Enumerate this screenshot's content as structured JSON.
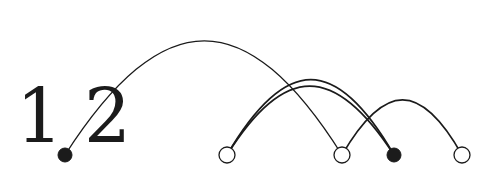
{
  "figure": {
    "label": "1.2",
    "label_parts": {
      "first_digit": "1",
      "second_digit": "2"
    },
    "background_color": "#ffffff",
    "stroke_color": "#1b1b1b",
    "fill_node_color": "#1b1b1b",
    "open_node_fill": "#ffffff",
    "width": 493,
    "height": 176
  },
  "chart_data": {
    "type": "arc-diagram",
    "title": "1.2",
    "xlabel": "",
    "ylabel": "",
    "grid": false,
    "legend": "none",
    "baseline_y": 155,
    "node_radius_open": 8,
    "node_radius_filled": 7,
    "nodes": [
      {
        "id": "n1",
        "x": 65,
        "y": 155,
        "style": "filled",
        "label": "",
        "note": "serves as the decimal point of 1.2"
      },
      {
        "id": "n2",
        "x": 227,
        "y": 155,
        "style": "open",
        "label": ""
      },
      {
        "id": "n3",
        "x": 342,
        "y": 155,
        "style": "open",
        "label": ""
      },
      {
        "id": "n4",
        "x": 394,
        "y": 155,
        "style": "filled",
        "label": ""
      },
      {
        "id": "n5",
        "x": 462,
        "y": 155,
        "style": "open",
        "label": ""
      }
    ],
    "edges": [
      {
        "id": "e1",
        "source": "n1",
        "target": "n3",
        "apex_x": 205,
        "apex_y": 14,
        "stroke_width": 1.3
      },
      {
        "id": "e2",
        "source": "n2",
        "target": "n4",
        "apex_x": 311,
        "apex_y": 62,
        "stroke_width": 1.8
      },
      {
        "id": "e3",
        "source": "n2",
        "target": "n4",
        "apex_x": 309,
        "apex_y": 70,
        "stroke_width": 1.8
      },
      {
        "id": "e4",
        "source": "n3",
        "target": "n5",
        "apex_x": 403,
        "apex_y": 87,
        "stroke_width": 1.6
      }
    ]
  }
}
